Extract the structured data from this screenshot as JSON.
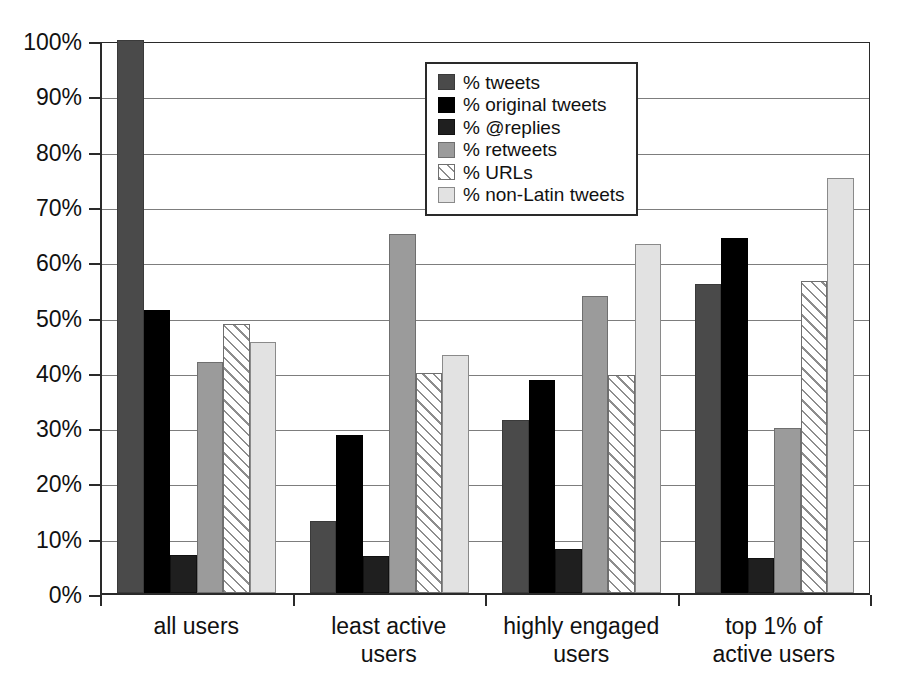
{
  "chart_data": {
    "type": "bar",
    "title": "",
    "subtitle": "",
    "xlabel": "",
    "ylabel": "",
    "ylim": [
      0,
      100
    ],
    "y_unit": "%",
    "grid": true,
    "legend_position": "inside-top-center",
    "categories": [
      "all users",
      "least active\nusers",
      "highly engaged\nusers",
      "top 1% of\nactive users"
    ],
    "category_lines": [
      [
        "all users"
      ],
      [
        "least active",
        "users"
      ],
      [
        "highly engaged",
        "users"
      ],
      [
        "top 1% of",
        "active users"
      ]
    ],
    "y_ticks": [
      "0%",
      "10%",
      "20%",
      "30%",
      "40%",
      "50%",
      "60%",
      "70%",
      "80%",
      "90%",
      "100%"
    ],
    "y_tick_values": [
      0,
      10,
      20,
      30,
      40,
      50,
      60,
      70,
      80,
      90,
      100
    ],
    "series": [
      {
        "name": "% tweets",
        "color": "#4a4a4a",
        "pattern": "solid",
        "values": [
          100,
          13.1,
          31.2,
          55.8
        ]
      },
      {
        "name": "% original tweets",
        "color": "#000000",
        "pattern": "solid",
        "values": [
          51.1,
          28.5,
          38.5,
          64.2
        ]
      },
      {
        "name": "% @replies",
        "color": "#1f1f1f",
        "pattern": "solid",
        "values": [
          6.8,
          6.7,
          8.0,
          6.3
        ]
      },
      {
        "name": "% retweets",
        "color": "#9b9b9b",
        "pattern": "solid",
        "values": [
          41.8,
          65.0,
          53.7,
          29.9
        ]
      },
      {
        "name": "% URLs",
        "color": "#ffffff",
        "pattern": "diagonal-hatch",
        "values": [
          48.6,
          39.7,
          39.5,
          56.4
        ]
      },
      {
        "name": "% non-Latin tweets",
        "color": "#e2e2e2",
        "pattern": "solid",
        "values": [
          45.4,
          43.1,
          63.2,
          75.0
        ]
      }
    ]
  }
}
